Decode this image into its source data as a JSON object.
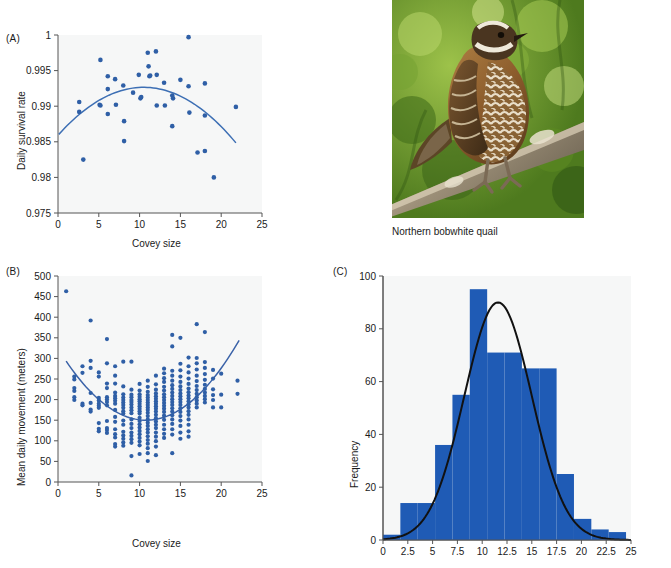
{
  "figure": {
    "panels": [
      "(A)",
      "(B)",
      "(C)"
    ],
    "photo_caption": "Northern bobwhite quail",
    "colors": {
      "scatter_dot": "#2f5fa6",
      "fit_curve_a": "#3d6fb4",
      "fit_curve_b": "#3a62a8",
      "bar_fill": "#1f5bb5",
      "curve_black": "#111111",
      "plot_bg": "#f6f7f7",
      "axis": "#555555"
    }
  },
  "chart_data": [
    {
      "panel": "(A)",
      "type": "scatter",
      "title": "",
      "xlabel": "Covey size",
      "ylabel": "Daily survival rate",
      "xlim": [
        0,
        25
      ],
      "ylim": [
        0.975,
        1.0
      ],
      "xticks": [
        0,
        5,
        10,
        15,
        20,
        25
      ],
      "yticks": [
        0.975,
        0.98,
        0.985,
        0.99,
        0.995,
        1
      ],
      "ytick_labels": [
        "0.975",
        "0.98",
        "0.985",
        "0.99",
        "0.995",
        "1"
      ],
      "grid": false,
      "legend": "none",
      "points": [
        [
          2.6,
          0.9906
        ],
        [
          2.6,
          0.9892
        ],
        [
          3.1,
          0.9825
        ],
        [
          5.2,
          0.9965
        ],
        [
          5.1,
          0.9902
        ],
        [
          5.2,
          0.9901
        ],
        [
          6.1,
          0.9942
        ],
        [
          6.1,
          0.9924
        ],
        [
          6.1,
          0.9889
        ],
        [
          7.0,
          0.9938
        ],
        [
          7.1,
          0.9902
        ],
        [
          8.0,
          0.9929
        ],
        [
          8.1,
          0.9879
        ],
        [
          8.1,
          0.9851
        ],
        [
          9.2,
          0.9919
        ],
        [
          9.9,
          0.9944
        ],
        [
          10.1,
          0.9911
        ],
        [
          10.2,
          0.9913
        ],
        [
          11.0,
          0.9975
        ],
        [
          11.1,
          0.9956
        ],
        [
          11.2,
          0.9942
        ],
        [
          11.3,
          0.9943
        ],
        [
          12.0,
          0.9977
        ],
        [
          12.1,
          0.9944
        ],
        [
          12.1,
          0.9901
        ],
        [
          13.0,
          0.9933
        ],
        [
          13.1,
          0.9901
        ],
        [
          14.0,
          0.9915
        ],
        [
          14.1,
          0.9911
        ],
        [
          14.0,
          0.9872
        ],
        [
          15.0,
          0.9937
        ],
        [
          16.0,
          0.9997
        ],
        [
          16.0,
          0.9928
        ],
        [
          16.1,
          0.9891
        ],
        [
          17.1,
          0.9835
        ],
        [
          18.0,
          0.9932
        ],
        [
          18.0,
          0.9887
        ],
        [
          18.0,
          0.9837
        ],
        [
          19.1,
          0.98
        ],
        [
          21.8,
          0.9899
        ]
      ],
      "fit": {
        "kind": "quadratic",
        "description": "downward parabola fit",
        "x_range": [
          0.1,
          21.8
        ],
        "vertex": [
          10.5,
          0.99265
        ],
        "y_at_xmin": 0.9853,
        "y_at_xmax": 0.98485
      }
    },
    {
      "panel": "(B)",
      "type": "scatter",
      "title": "",
      "xlabel": "Covey size",
      "ylabel": "Mean daily movement (meters)",
      "xlim": [
        0,
        25
      ],
      "ylim": [
        0,
        500
      ],
      "xticks": [
        0,
        5,
        10,
        15,
        20,
        25
      ],
      "yticks": [
        0,
        50,
        100,
        150,
        200,
        250,
        300,
        350,
        400,
        450,
        500
      ],
      "grid": false,
      "legend": "none",
      "points": [
        [
          1,
          463
        ],
        [
          2,
          256
        ],
        [
          2,
          249
        ],
        [
          2,
          228
        ],
        [
          2,
          221
        ],
        [
          2,
          206
        ],
        [
          2,
          199
        ],
        [
          3,
          281
        ],
        [
          3,
          265
        ],
        [
          3,
          190
        ],
        [
          3,
          186
        ],
        [
          4,
          392
        ],
        [
          4,
          277
        ],
        [
          4,
          294
        ],
        [
          4,
          216
        ],
        [
          4,
          192
        ],
        [
          4,
          176
        ],
        [
          4,
          171
        ],
        [
          5,
          266
        ],
        [
          5,
          256
        ],
        [
          5,
          204
        ],
        [
          5,
          198
        ],
        [
          5,
          190
        ],
        [
          5,
          185
        ],
        [
          5,
          180
        ],
        [
          5,
          143
        ],
        [
          5,
          129
        ],
        [
          5,
          123
        ],
        [
          6,
          347
        ],
        [
          6,
          288
        ],
        [
          6,
          228
        ],
        [
          6,
          239
        ],
        [
          6,
          206
        ],
        [
          6,
          200
        ],
        [
          6,
          194
        ],
        [
          6,
          186
        ],
        [
          6,
          148
        ],
        [
          6,
          131
        ],
        [
          6,
          126
        ],
        [
          6,
          119
        ],
        [
          7,
          281
        ],
        [
          7,
          258
        ],
        [
          7,
          239
        ],
        [
          7,
          217
        ],
        [
          7,
          209
        ],
        [
          7,
          203
        ],
        [
          7,
          197
        ],
        [
          7,
          190
        ],
        [
          7,
          175
        ],
        [
          7,
          158
        ],
        [
          7,
          146
        ],
        [
          7,
          128
        ],
        [
          7,
          116
        ],
        [
          7,
          108
        ],
        [
          7,
          92
        ],
        [
          7,
          86
        ],
        [
          8,
          292
        ],
        [
          8,
          232
        ],
        [
          8,
          213
        ],
        [
          8,
          205
        ],
        [
          8,
          199
        ],
        [
          8,
          193
        ],
        [
          8,
          187
        ],
        [
          8,
          180
        ],
        [
          8,
          172
        ],
        [
          8,
          166
        ],
        [
          8,
          149
        ],
        [
          8,
          139
        ],
        [
          8,
          122
        ],
        [
          8,
          113
        ],
        [
          8,
          105
        ],
        [
          8,
          96
        ],
        [
          8,
          88
        ],
        [
          9,
          292
        ],
        [
          9,
          224
        ],
        [
          9,
          212
        ],
        [
          9,
          206
        ],
        [
          9,
          199
        ],
        [
          9,
          194
        ],
        [
          9,
          188
        ],
        [
          9,
          181
        ],
        [
          9,
          174
        ],
        [
          9,
          167
        ],
        [
          9,
          152
        ],
        [
          9,
          141
        ],
        [
          9,
          131
        ],
        [
          9,
          120
        ],
        [
          9,
          112
        ],
        [
          9,
          104
        ],
        [
          9,
          95
        ],
        [
          9,
          63
        ],
        [
          9,
          16
        ],
        [
          10,
          238
        ],
        [
          10,
          222
        ],
        [
          10,
          213
        ],
        [
          10,
          207
        ],
        [
          10,
          201
        ],
        [
          10,
          196
        ],
        [
          10,
          190
        ],
        [
          10,
          184
        ],
        [
          10,
          178
        ],
        [
          10,
          172
        ],
        [
          10,
          166
        ],
        [
          10,
          156
        ],
        [
          10,
          148
        ],
        [
          10,
          140
        ],
        [
          10,
          132
        ],
        [
          10,
          124
        ],
        [
          10,
          116
        ],
        [
          10,
          107
        ],
        [
          10,
          98
        ],
        [
          10,
          89
        ],
        [
          10,
          68
        ],
        [
          11,
          246
        ],
        [
          11,
          231
        ],
        [
          11,
          219
        ],
        [
          11,
          211
        ],
        [
          11,
          205
        ],
        [
          11,
          199
        ],
        [
          11,
          193
        ],
        [
          11,
          187
        ],
        [
          11,
          181
        ],
        [
          11,
          175
        ],
        [
          11,
          168
        ],
        [
          11,
          160
        ],
        [
          11,
          152
        ],
        [
          11,
          144
        ],
        [
          11,
          136
        ],
        [
          11,
          128
        ],
        [
          11,
          120
        ],
        [
          11,
          111
        ],
        [
          11,
          102
        ],
        [
          11,
          93
        ],
        [
          11,
          82
        ],
        [
          11,
          70
        ],
        [
          11,
          51
        ],
        [
          12,
          258
        ],
        [
          12,
          237
        ],
        [
          12,
          224
        ],
        [
          12,
          215
        ],
        [
          12,
          208
        ],
        [
          12,
          202
        ],
        [
          12,
          196
        ],
        [
          12,
          190
        ],
        [
          12,
          184
        ],
        [
          12,
          178
        ],
        [
          12,
          171
        ],
        [
          12,
          163
        ],
        [
          12,
          155
        ],
        [
          12,
          147
        ],
        [
          12,
          139
        ],
        [
          12,
          131
        ],
        [
          12,
          120
        ],
        [
          12,
          110
        ],
        [
          12,
          99
        ],
        [
          12,
          86
        ],
        [
          12,
          65
        ],
        [
          13,
          275
        ],
        [
          13,
          264
        ],
        [
          13,
          252
        ],
        [
          13,
          243
        ],
        [
          13,
          231
        ],
        [
          13,
          222
        ],
        [
          13,
          213
        ],
        [
          13,
          206
        ],
        [
          13,
          199
        ],
        [
          13,
          192
        ],
        [
          13,
          185
        ],
        [
          13,
          178
        ],
        [
          13,
          170
        ],
        [
          13,
          161
        ],
        [
          13,
          151
        ],
        [
          13,
          139
        ],
        [
          13,
          128
        ],
        [
          13,
          117
        ],
        [
          13,
          107
        ],
        [
          14,
          357
        ],
        [
          14,
          329
        ],
        [
          14,
          270
        ],
        [
          14,
          258
        ],
        [
          14,
          246
        ],
        [
          14,
          235
        ],
        [
          14,
          226
        ],
        [
          14,
          217
        ],
        [
          14,
          209
        ],
        [
          14,
          201
        ],
        [
          14,
          194
        ],
        [
          14,
          187
        ],
        [
          14,
          179
        ],
        [
          14,
          171
        ],
        [
          14,
          162
        ],
        [
          14,
          152
        ],
        [
          14,
          141
        ],
        [
          14,
          128
        ],
        [
          14,
          115
        ],
        [
          14,
          70
        ],
        [
          15,
          350
        ],
        [
          15,
          287
        ],
        [
          15,
          271
        ],
        [
          15,
          256
        ],
        [
          15,
          243
        ],
        [
          15,
          232
        ],
        [
          15,
          223
        ],
        [
          15,
          215
        ],
        [
          15,
          208
        ],
        [
          15,
          201
        ],
        [
          15,
          194
        ],
        [
          15,
          187
        ],
        [
          15,
          179
        ],
        [
          15,
          170
        ],
        [
          15,
          160
        ],
        [
          15,
          149
        ],
        [
          15,
          136
        ],
        [
          15,
          120
        ],
        [
          15,
          105
        ],
        [
          16,
          302
        ],
        [
          16,
          281
        ],
        [
          16,
          266
        ],
        [
          16,
          251
        ],
        [
          16,
          238
        ],
        [
          16,
          227
        ],
        [
          16,
          218
        ],
        [
          16,
          210
        ],
        [
          16,
          203
        ],
        [
          16,
          196
        ],
        [
          16,
          189
        ],
        [
          16,
          181
        ],
        [
          16,
          172
        ],
        [
          16,
          163
        ],
        [
          16,
          152
        ],
        [
          16,
          139
        ],
        [
          16,
          123
        ],
        [
          16,
          110
        ],
        [
          17,
          383
        ],
        [
          17,
          301
        ],
        [
          17,
          288
        ],
        [
          17,
          273
        ],
        [
          17,
          258
        ],
        [
          17,
          245
        ],
        [
          17,
          233
        ],
        [
          17,
          223
        ],
        [
          17,
          214
        ],
        [
          17,
          206
        ],
        [
          17,
          198
        ],
        [
          17,
          190
        ],
        [
          17,
          181
        ],
        [
          18,
          364
        ],
        [
          18,
          291
        ],
        [
          18,
          277
        ],
        [
          18,
          262
        ],
        [
          18,
          248
        ],
        [
          18,
          236
        ],
        [
          18,
          226
        ],
        [
          18,
          217
        ],
        [
          18,
          209
        ],
        [
          18,
          201
        ],
        [
          18,
          193
        ],
        [
          19,
          272
        ],
        [
          19,
          251
        ],
        [
          19,
          225
        ],
        [
          19,
          211
        ],
        [
          19,
          199
        ],
        [
          19,
          181
        ],
        [
          20,
          263
        ],
        [
          20,
          212
        ],
        [
          20,
          181
        ],
        [
          22,
          246
        ],
        [
          22,
          214
        ]
      ],
      "fit": {
        "kind": "quadratic",
        "description": "upward parabola fit",
        "x_range": [
          1.0,
          22.2
        ],
        "vertex": [
          10.8,
          150
        ],
        "y_at_xmin": 284,
        "y_at_xmax": 344
      }
    },
    {
      "panel": "(C)",
      "type": "bar",
      "subtype": "histogram",
      "title": "",
      "xlabel": "",
      "ylabel": "Frequency",
      "xlim": [
        0,
        25
      ],
      "ylim": [
        0,
        100
      ],
      "xticks": [
        0,
        2.5,
        5,
        7.5,
        10,
        12.5,
        15,
        17.5,
        20,
        22.5,
        25
      ],
      "xtick_labels": [
        "0",
        "2.5",
        "5",
        "7.5",
        "10",
        "12.5",
        "15",
        "17.5",
        "20",
        "22.5",
        "25"
      ],
      "yticks": [
        0,
        20,
        40,
        60,
        80,
        100
      ],
      "grid": false,
      "legend": "none",
      "bin_width": 1.75,
      "bin_starts": [
        0,
        1.75,
        3.5,
        5.25,
        7.0,
        8.75,
        10.5,
        12.25,
        14.0,
        15.75,
        17.5,
        19.25,
        21.0,
        22.75
      ],
      "categories": [
        "0-1.75",
        "1.75-3.5",
        "3.5-5.25",
        "5.25-7",
        "7-8.75",
        "8.75-10.5",
        "10.5-12.25",
        "12.25-14",
        "14-15.75",
        "15.75-17.5",
        "17.5-19.25",
        "19.25-21",
        "21-22.75",
        "22.75-24.5"
      ],
      "values": [
        2,
        14,
        14,
        36,
        55,
        95,
        71,
        71,
        65,
        65,
        25,
        8,
        4,
        3
      ],
      "overlay_curve": {
        "kind": "normal",
        "description": "fitted normal density curve",
        "mean": 11.6,
        "sd": 3.4,
        "peak": 90
      }
    }
  ]
}
